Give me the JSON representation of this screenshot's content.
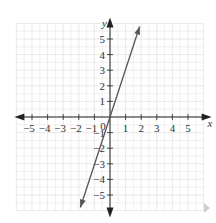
{
  "chart_data": {
    "type": "line",
    "title": "",
    "xlabel": "x",
    "ylabel": "y",
    "xlim": [
      -6,
      6
    ],
    "ylim": [
      -6,
      6
    ],
    "grid": true,
    "x_ticks": [
      -5,
      -4,
      -3,
      -2,
      -1,
      1,
      2,
      3,
      4,
      5
    ],
    "y_ticks": [
      -5,
      -4,
      -3,
      -2,
      -1,
      1,
      2,
      3,
      4,
      5
    ],
    "origin_label": "0",
    "series": [
      {
        "name": "y = 3x",
        "equation": "y = 3x",
        "slope": 3,
        "intercept": 0,
        "x": [
          -1.9,
          0,
          1,
          1.9
        ],
        "y": [
          -5.8,
          0,
          3,
          5.8
        ],
        "arrows_both_ends": true
      }
    ]
  },
  "colors": {
    "axis": "#222222",
    "line": "#555555",
    "grid": "#e6e6e6",
    "label": "#333333",
    "nav_arrow": "#cfcfcf"
  },
  "nav": {
    "next_icon": "triangle-right"
  }
}
